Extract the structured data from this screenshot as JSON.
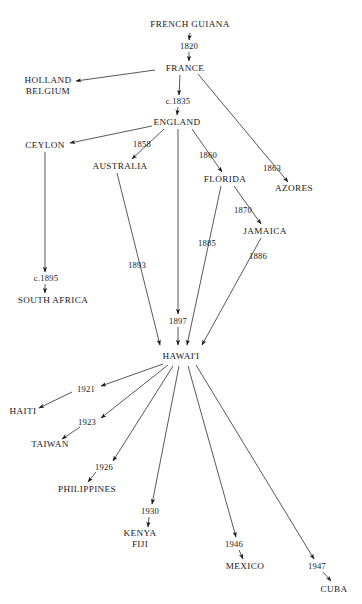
{
  "diagram": {
    "background_color": "#ffffff",
    "ink_color": "#17171a",
    "width": 362,
    "height": 604,
    "nodes": [
      {
        "id": "french_guiana",
        "label": "FRENCH GUIANA",
        "lines": [
          "FRENCH GUIANA"
        ],
        "x": 190,
        "y": 24
      },
      {
        "id": "france",
        "label": "FRANCE",
        "lines": [
          "FRANCE"
        ],
        "x": 185,
        "y": 68
      },
      {
        "id": "holland_belgium",
        "label": "HOLLAND BELGIUM",
        "lines": [
          "HOLLAND",
          "BELGIUM"
        ],
        "x": 48,
        "y": 86
      },
      {
        "id": "england",
        "label": "ENGLAND",
        "lines": [
          "ENGLAND"
        ],
        "x": 177,
        "y": 122
      },
      {
        "id": "ceylon",
        "label": "CEYLON",
        "lines": [
          "CEYLON"
        ],
        "x": 45,
        "y": 145
      },
      {
        "id": "australia",
        "label": "AUSTRALIA",
        "lines": [
          "AUSTRALIA"
        ],
        "x": 120,
        "y": 166
      },
      {
        "id": "florida",
        "label": "FLORIDA",
        "lines": [
          "FLORIDA"
        ],
        "x": 225,
        "y": 179
      },
      {
        "id": "azores",
        "label": "AZORES",
        "lines": [
          "AZORES"
        ],
        "x": 294,
        "y": 188
      },
      {
        "id": "jamaica",
        "label": "JAMAICA",
        "lines": [
          "JAMAICA"
        ],
        "x": 265,
        "y": 231
      },
      {
        "id": "south_africa",
        "label": "SOUTH AFRICA",
        "lines": [
          "SOUTH AFRICA"
        ],
        "x": 53,
        "y": 300
      },
      {
        "id": "hawaii",
        "label": "HAWAI'I",
        "lines": [
          "HAWAI'I"
        ],
        "x": 181,
        "y": 356
      },
      {
        "id": "haiti",
        "label": "HAITI",
        "lines": [
          "HAITI"
        ],
        "x": 23,
        "y": 411
      },
      {
        "id": "taiwan",
        "label": "TAIWAN",
        "lines": [
          "TAIWAN"
        ],
        "x": 50,
        "y": 444
      },
      {
        "id": "philippines",
        "label": "PHILIPPINES",
        "lines": [
          "PHILIPPINES"
        ],
        "x": 87,
        "y": 489
      },
      {
        "id": "kenya_fiji",
        "label": "KENYA FIJI",
        "lines": [
          "KENYA",
          "FIJI"
        ],
        "x": 140,
        "y": 539
      },
      {
        "id": "mexico",
        "label": "MEXICO",
        "lines": [
          "MEXICO"
        ],
        "x": 245,
        "y": 566
      },
      {
        "id": "cuba",
        "label": "CUBA",
        "lines": [
          "CUBA"
        ],
        "x": 334,
        "y": 589
      }
    ],
    "edges": [
      {
        "id": "e1",
        "from": "french_guiana",
        "to": "france",
        "year": "1820",
        "year_x": 189,
        "year_y": 46
      },
      {
        "id": "e2",
        "from": "france",
        "to": "holland_belgium",
        "year": "",
        "year_x": 0,
        "year_y": 0
      },
      {
        "id": "e3",
        "from": "france",
        "to": "england",
        "year": "c.1835",
        "year_x": 178,
        "year_y": 101
      },
      {
        "id": "e4",
        "from": "england",
        "to": "ceylon",
        "year": "",
        "year_x": 0,
        "year_y": 0
      },
      {
        "id": "e5",
        "from": "england",
        "to": "australia",
        "year": "1858",
        "year_x": 142,
        "year_y": 144
      },
      {
        "id": "e6",
        "from": "england",
        "to": "florida",
        "year": "1860",
        "year_x": 208,
        "year_y": 155
      },
      {
        "id": "e7",
        "from": "france",
        "to": "azores",
        "year": "1863",
        "year_x": 272,
        "year_y": 168
      },
      {
        "id": "e8",
        "from": "florida",
        "to": "jamaica",
        "year": "1870",
        "year_x": 243,
        "year_y": 210
      },
      {
        "id": "e9",
        "from": "ceylon",
        "to": "south_africa",
        "year": "c.1895",
        "year_x": 46,
        "year_y": 278
      },
      {
        "id": "e10",
        "from": "australia",
        "to": "hawaii",
        "year": "1893",
        "year_x": 137,
        "year_y": 265
      },
      {
        "id": "e11",
        "from": "england",
        "to": "hawaii",
        "year": "1897",
        "year_x": 178,
        "year_y": 321
      },
      {
        "id": "e12",
        "from": "florida",
        "to": "hawaii",
        "year": "1885",
        "year_x": 207,
        "year_y": 243
      },
      {
        "id": "e13",
        "from": "jamaica",
        "to": "hawaii",
        "year": "1886",
        "year_x": 258,
        "year_y": 256
      },
      {
        "id": "e14",
        "from": "hawaii",
        "to": "haiti",
        "year": "1921",
        "year_x": 86,
        "year_y": 389
      },
      {
        "id": "e15",
        "from": "hawaii",
        "to": "taiwan",
        "year": "1923",
        "year_x": 87,
        "year_y": 422
      },
      {
        "id": "e16",
        "from": "hawaii",
        "to": "philippines",
        "year": "1926",
        "year_x": 104,
        "year_y": 467
      },
      {
        "id": "e17",
        "from": "hawaii",
        "to": "kenya_fiji",
        "year": "1930",
        "year_x": 150,
        "year_y": 511
      },
      {
        "id": "e18",
        "from": "hawaii",
        "to": "mexico",
        "year": "1946",
        "year_x": 234,
        "year_y": 544
      },
      {
        "id": "e19",
        "from": "hawaii",
        "to": "cuba",
        "year": "1947",
        "year_x": 317,
        "year_y": 566
      }
    ]
  }
}
